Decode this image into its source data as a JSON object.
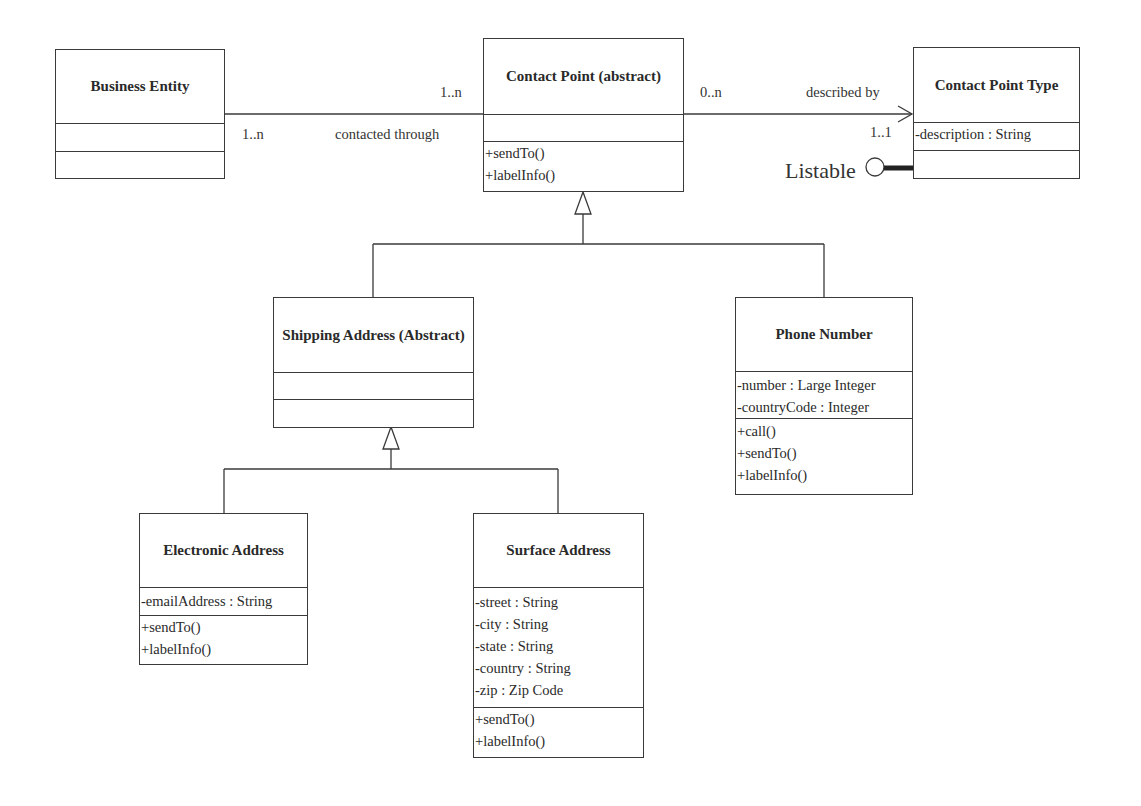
{
  "diagram": {
    "type": "UML class diagram",
    "classes": {
      "business_entity": {
        "name": "Business Entity",
        "attributes": [],
        "operations": []
      },
      "contact_point": {
        "name": "Contact Point (abstract)",
        "attributes": [],
        "operations": [
          "+sendTo()",
          "+labelInfo()"
        ]
      },
      "contact_point_type": {
        "name": "Contact Point Type",
        "attributes": [
          "-description : String"
        ],
        "operations": []
      },
      "shipping_address": {
        "name": "Shipping Address (Abstract)",
        "attributes": [],
        "operations": []
      },
      "phone_number": {
        "name": "Phone Number",
        "attributes": [
          "-number : Large Integer",
          "-countryCode : Integer"
        ],
        "operations": [
          "+call()",
          "+sendTo()",
          "+labelInfo()"
        ]
      },
      "electronic_address": {
        "name": "Electronic Address",
        "attributes": [
          "-emailAddress : String"
        ],
        "operations": [
          "+sendTo()",
          "+labelInfo()"
        ]
      },
      "surface_address": {
        "name": "Surface Address",
        "attributes": [
          "-street : String",
          "-city : String",
          "-state : String",
          "-country : String",
          "-zip : Zip Code"
        ],
        "operations": [
          "+sendTo()",
          "+labelInfo()"
        ]
      }
    },
    "associations": {
      "contacted_through": {
        "label": "contacted through",
        "source_multiplicity": "1..n",
        "target_multiplicity": "1..n"
      },
      "described_by": {
        "label": "described by",
        "source_multiplicity": "0..n",
        "target_multiplicity": "1..1"
      }
    },
    "interface": {
      "name": "Listable"
    },
    "generalizations": [
      {
        "parent": "Contact Point (abstract)",
        "children": [
          "Shipping Address (Abstract)",
          "Phone Number"
        ]
      },
      {
        "parent": "Shipping Address (Abstract)",
        "children": [
          "Electronic Address",
          "Surface Address"
        ]
      }
    ]
  }
}
